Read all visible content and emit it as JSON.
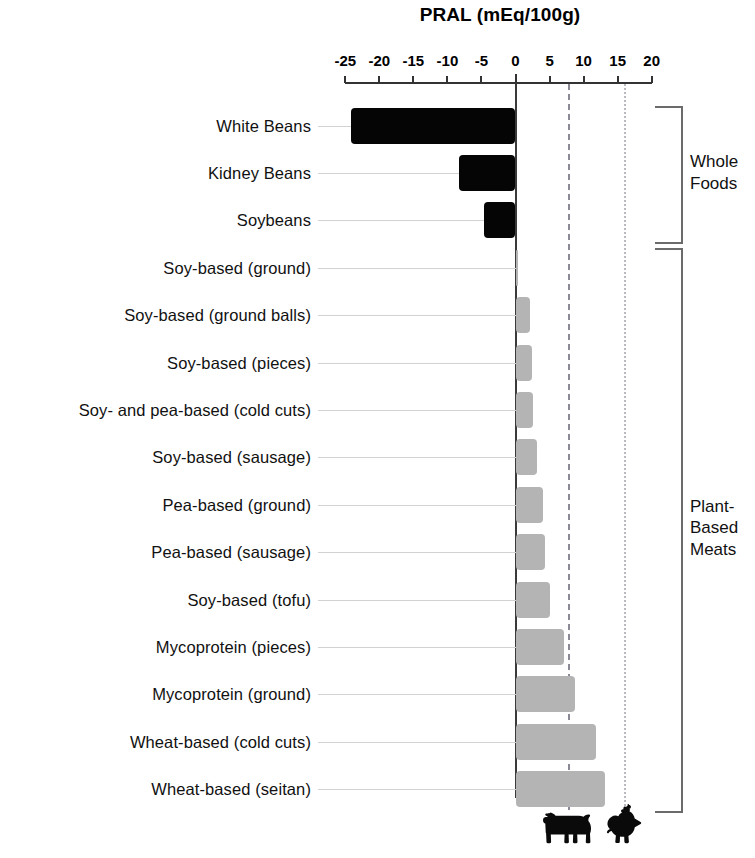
{
  "chart_data": {
    "type": "bar",
    "orientation": "horizontal",
    "title": "PRAL (mEq/100g)",
    "xlabel": "PRAL (mEq/100g)",
    "ylabel": "",
    "xlim": [
      -27,
      21
    ],
    "xticks": [
      -25,
      -20,
      -15,
      -10,
      -5,
      0,
      5,
      10,
      15,
      20
    ],
    "xticklabels": [
      "-25",
      "-20",
      "-15",
      "-10",
      "-5",
      "0",
      "5",
      "10",
      "15",
      "20"
    ],
    "grid": false,
    "categories": [
      "White Beans",
      "Kidney Beans",
      "Soybeans",
      "Soy-based (ground)",
      "Soy-based (ground balls)",
      "Soy-based (pieces)",
      "Soy- and pea-based (cold cuts)",
      "Soy-based (sausage)",
      "Pea-based (ground)",
      "Pea-based (sausage)",
      "Soy-based (tofu)",
      "Mycoprotein (pieces)",
      "Mycoprotein (ground)",
      "Wheat-based (cold cuts)",
      "Wheat-based (seitan)"
    ],
    "values": [
      -24.2,
      -8.3,
      -4.6,
      0.3,
      2.2,
      2.4,
      2.6,
      3.1,
      4.0,
      4.3,
      5.0,
      7.1,
      8.8,
      11.8,
      13.2
    ],
    "bar_colors": [
      "#050505",
      "#050505",
      "#050505",
      "#b4b4b4",
      "#b4b4b4",
      "#b4b4b4",
      "#b4b4b4",
      "#b4b4b4",
      "#b4b4b4",
      "#b4b4b4",
      "#b4b4b4",
      "#b4b4b4",
      "#b4b4b4",
      "#b4b4b4",
      "#b4b4b4"
    ],
    "reference_lines": [
      {
        "name": "beef",
        "value": 7.8,
        "style": "dashed",
        "color": "#8a8a96",
        "icon": "cow-icon"
      },
      {
        "name": "chicken",
        "value": 16.1,
        "style": "dotted",
        "color": "#b9b9c2",
        "icon": "chicken-icon"
      }
    ],
    "groups": [
      {
        "label": "Whole\nFoods",
        "label_lines": [
          "Whole",
          "Foods"
        ],
        "from": 0,
        "to": 2
      },
      {
        "label": "Plant-\nBased\nMeats",
        "label_lines": [
          "Plant-",
          "Based",
          "Meats"
        ],
        "from": 3,
        "to": 14
      }
    ],
    "colors": {
      "whole_food_bar": "#050505",
      "plant_based_bar": "#b4b4b4",
      "axis": "#333333",
      "beef_line": "#8a8a96",
      "chicken_line": "#b9b9c2",
      "background": "#ffffff"
    }
  },
  "icons": {
    "cow": "cow-icon",
    "chicken": "chicken-icon"
  }
}
